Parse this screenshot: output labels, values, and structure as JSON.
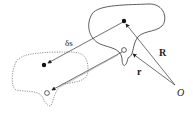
{
  "diagram": {
    "labels": {
      "R": "R",
      "r": "r",
      "ds": "δs",
      "O": "O"
    },
    "colors": {
      "stroke": "#333333",
      "dotted": "#777777"
    }
  }
}
